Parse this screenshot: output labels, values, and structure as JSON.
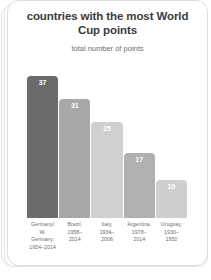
{
  "card": {
    "title": "countries with the\nmost World Cup points",
    "subtitle": "total number of points"
  },
  "chart_data": {
    "type": "bar",
    "title": "countries with the most World Cup points",
    "subtitle": "total number of points",
    "xlabel": "",
    "ylabel": "total number of points",
    "ylim": [
      0,
      40
    ],
    "grid": false,
    "legend": false,
    "categories": [
      "Germany/\nW. Germany,\n1954–2014",
      "Brazil,\n1958–\n2014",
      "Italy,\n1934–\n2006",
      "Argentina,\n1978–\n2014",
      "Uruguay,\n1930–\n1950"
    ],
    "values": [
      37,
      31,
      25,
      17,
      10
    ],
    "bar_colors": [
      "#6b6b6b",
      "#a8a8a8",
      "#d0d0d0",
      "#b0b0b0",
      "#cfcfcf"
    ],
    "value_label_colors": [
      "#ffffff",
      "#ffffff",
      "#ffffff",
      "#ffffff",
      "#ffffff"
    ],
    "bars": [
      {
        "label": "Germany/\nW. Germany,\n1954–2014",
        "value": 37,
        "value_text": "37",
        "color": "#6b6b6b"
      },
      {
        "label": "Brazil,\n1958–\n2014",
        "value": 31,
        "value_text": "31",
        "color": "#a8a8a8"
      },
      {
        "label": "Italy,\n1934–\n2006",
        "value": 25,
        "value_text": "25",
        "color": "#d0d0d0"
      },
      {
        "label": "Argentina,\n1978–\n2014",
        "value": 17,
        "value_text": "17",
        "color": "#b0b0b0"
      },
      {
        "label": "Uruguay,\n1930–\n1950",
        "value": 10,
        "value_text": "10",
        "color": "#cfcfcf"
      }
    ]
  }
}
